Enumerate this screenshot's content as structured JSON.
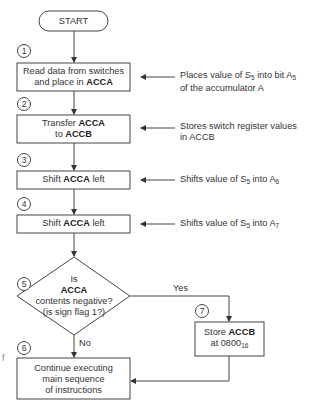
{
  "flowchart": {
    "start": "START",
    "steps": [
      {
        "num": "1",
        "pre": "Read data from switches",
        "line2_pre": "and place in ",
        "bold": "ACCA"
      },
      {
        "num": "2",
        "pre": "Transfer ",
        "bold": "ACCA",
        "line2_pre": "to ",
        "bold2": "ACCB"
      },
      {
        "num": "3",
        "pre": "Shift ",
        "bold": "ACCA",
        "post": " left"
      },
      {
        "num": "4",
        "pre": "Shift ",
        "bold": "ACCA",
        "post": " left"
      },
      {
        "num": "5",
        "line1": "Is",
        "bold": "ACCA",
        "line3": "contents negative?",
        "line4": "(is sign flag 1?)"
      },
      {
        "num": "6",
        "line1": "Continue executing",
        "line2": "main sequence",
        "line3": "of instructions"
      },
      {
        "num": "7",
        "pre": "Store ",
        "bold": "ACCB",
        "line2_pre": "at 0800",
        "sub": "16"
      }
    ],
    "branch_yes": "Yes",
    "branch_no": "No",
    "annotations": [
      {
        "line1_a": "Places value of S",
        "line1_s1": "5",
        "line1_b": " into bit A",
        "line1_s2": "5",
        "line2": "of the accumulator A"
      },
      {
        "line1": "Stores switch register values",
        "line2": "in ACCB"
      },
      {
        "a": "Shifts value of S",
        "s1": "5",
        "b": " into A",
        "s2": "6"
      },
      {
        "a": "Shifts value of S",
        "s1": "5",
        "b": " into A",
        "s2": "7"
      }
    ],
    "edge_fragment": "f"
  }
}
